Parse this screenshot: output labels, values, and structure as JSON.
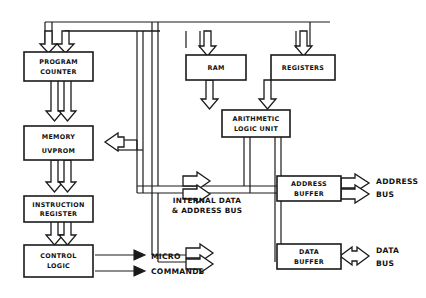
{
  "diagram": {
    "blocks": [
      {
        "id": "program_counter",
        "line1": "PROGRAM",
        "line2": "COUNTER"
      },
      {
        "id": "memory",
        "line1": "MEMORY",
        "line2": "UVPROM"
      },
      {
        "id": "instruction_reg",
        "line1": "INSTRUCTION",
        "line2": "REGISTER"
      },
      {
        "id": "control_logic",
        "line1": "CONTROL",
        "line2": "LOGIC"
      },
      {
        "id": "ram",
        "line1": "RAM",
        "line2": ""
      },
      {
        "id": "registers",
        "line1": "REGISTERS",
        "line2": ""
      },
      {
        "id": "alu",
        "line1": "ARITHMETIC",
        "line2": "LOGIC UNIT"
      },
      {
        "id": "address_buffer",
        "line1": "ADDRESS",
        "line2": "BUFFER"
      },
      {
        "id": "data_buffer",
        "line1": "DATA",
        "line2": "BUFFER"
      }
    ],
    "bus_label": {
      "line1": "INTERNAL DATA",
      "line2": "& ADDRESS BUS"
    },
    "outputs": [
      {
        "id": "micro_commands",
        "line1": "MICRO",
        "line2": "COMMANDS"
      },
      {
        "id": "address_bus",
        "line1": "ADDRESS",
        "line2": "BUS"
      },
      {
        "id": "data_bus",
        "line1": "DATA",
        "line2": "BUS"
      }
    ],
    "colors": {
      "ink": "#1a1a1a",
      "paper": "#ffffff"
    }
  }
}
